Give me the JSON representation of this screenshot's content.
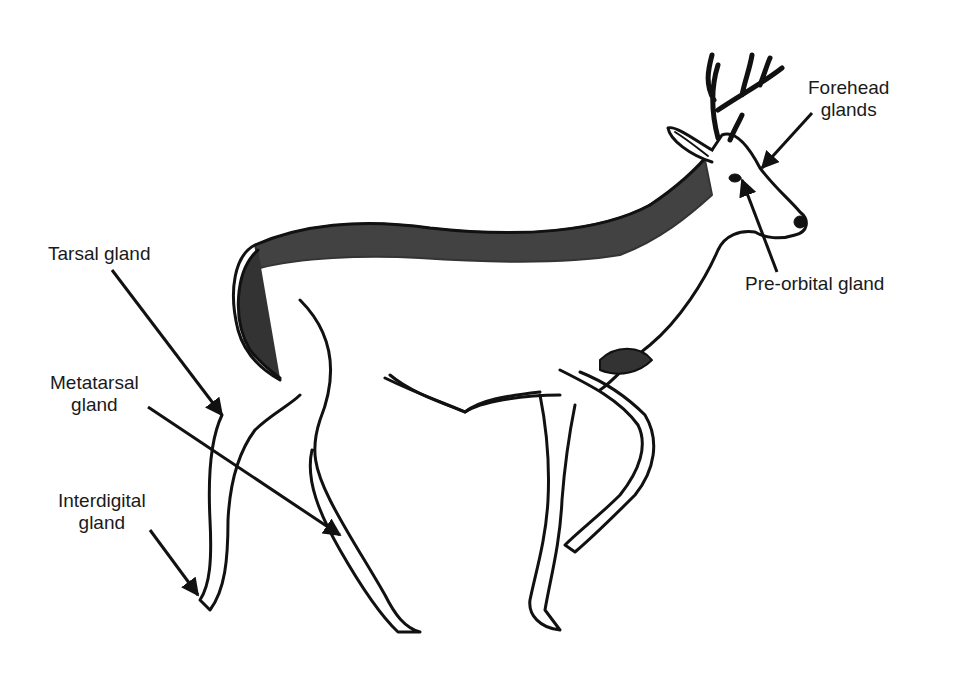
{
  "diagram": {
    "colors": {
      "ink": "#111111",
      "background": "#ffffff"
    },
    "labels": [
      {
        "id": "tarsal",
        "lines": [
          "Tarsal gland"
        ],
        "x": 48,
        "y": 243,
        "align": "left"
      },
      {
        "id": "metatarsal",
        "lines": [
          "Metatarsal",
          "gland"
        ],
        "x": 50,
        "y": 372,
        "align": "center"
      },
      {
        "id": "interdigital",
        "lines": [
          "Interdigital",
          "gland"
        ],
        "x": 58,
        "y": 490,
        "align": "center"
      },
      {
        "id": "forehead",
        "lines": [
          "Forehead",
          "glands"
        ],
        "x": 808,
        "y": 77,
        "align": "center"
      },
      {
        "id": "preorbital",
        "lines": [
          "Pre-orbital gland"
        ],
        "x": 745,
        "y": 273,
        "align": "left"
      }
    ],
    "arrows": [
      {
        "for": "tarsal",
        "from": [
          112,
          270
        ],
        "to": [
          222,
          415
        ]
      },
      {
        "for": "metatarsal",
        "from": [
          148,
          407
        ],
        "to": [
          340,
          535
        ]
      },
      {
        "for": "interdigital",
        "from": [
          150,
          530
        ],
        "to": [
          198,
          595
        ]
      },
      {
        "for": "forehead",
        "from": [
          812,
          113
        ],
        "to": [
          762,
          168
        ]
      },
      {
        "for": "preorbital",
        "from": [
          777,
          272
        ],
        "to": [
          742,
          180
        ]
      }
    ]
  }
}
